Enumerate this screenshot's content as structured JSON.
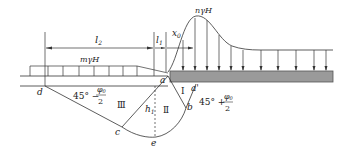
{
  "diagram": {
    "labels": {
      "l2": "l",
      "l2_sub": "2",
      "l1": "l",
      "l1_sub": "1",
      "x0": "x",
      "x0_sub": "0",
      "surcharge_left": "mγH",
      "peak_load": "nγH",
      "point_a": "a",
      "point_a_prime": "a'",
      "point_b": "b",
      "point_c": "c",
      "point_d": "d",
      "point_e": "e",
      "h1": "h",
      "h1_sub": "1",
      "zone_I": "Ⅰ",
      "zone_II": "Ⅱ",
      "zone_III": "Ⅲ",
      "angle_passive_prefix": "45° −",
      "angle_passive_num": "φ",
      "angle_passive_num_sub": "0",
      "angle_passive_den": "2",
      "angle_active_prefix": "45° +",
      "angle_active_num": "φ",
      "angle_active_num_sub": "0",
      "angle_active_den": "2"
    },
    "colors": {
      "line": "#333333",
      "footing_fill": "#9a9a9a",
      "footing_stroke": "#555555"
    }
  }
}
